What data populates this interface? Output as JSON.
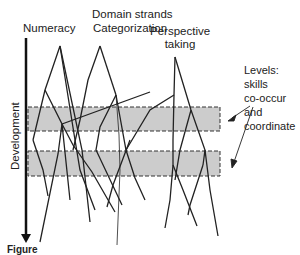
{
  "title": "Domain strands",
  "strands": [
    {
      "label": "Numeracy"
    },
    {
      "label": "Categorization"
    },
    {
      "label": "Perspective taking"
    }
  ],
  "axis": {
    "label": "Development",
    "direction": "down"
  },
  "levels_note": {
    "line1": "Levels: skills",
    "line2": "co-occur and",
    "line3": "coordinate"
  },
  "level_bands": [
    {
      "name": "level-1",
      "y_top": 107,
      "y_bottom": 131
    },
    {
      "name": "level-2",
      "y_top": 150,
      "y_bottom": 175
    }
  ],
  "caption": "Figure"
}
